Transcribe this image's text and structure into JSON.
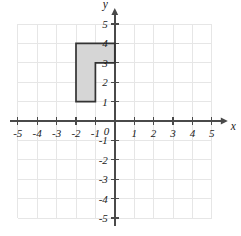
{
  "figure": {
    "title": "",
    "background_color": "#ffffff",
    "grid_color": "#e6e6e6",
    "axis_color": "#4a4a4a"
  },
  "chart_data": {
    "type": "scatter",
    "title": "",
    "xlabel": "x",
    "ylabel": "y",
    "xlim": [
      -5,
      5
    ],
    "ylim": [
      -5,
      5
    ],
    "grid": true,
    "legend": "none",
    "x_ticks": [
      "-5",
      "-4",
      "-3",
      "-2",
      "-1",
      "1",
      "2",
      "3",
      "4",
      "5"
    ],
    "x_tick_values": [
      -5,
      -4,
      -3,
      -2,
      -1,
      1,
      2,
      3,
      4,
      5
    ],
    "y_ticks": [
      "5",
      "4",
      "3",
      "2",
      "1",
      "-1",
      "-2",
      "-3",
      "-4",
      "-5"
    ],
    "y_tick_values": [
      5,
      4,
      3,
      2,
      1,
      -1,
      -2,
      -3,
      -4,
      -5
    ],
    "origin_label": "0",
    "shapes": [
      {
        "name": "l-shaped-polygon",
        "fill": "#d6d6d6",
        "stroke": "#333333",
        "vertices": [
          [
            -2,
            4
          ],
          [
            0,
            4
          ],
          [
            0,
            3
          ],
          [
            -1,
            3
          ],
          [
            -1,
            1
          ],
          [
            -2,
            1
          ]
        ]
      }
    ]
  }
}
